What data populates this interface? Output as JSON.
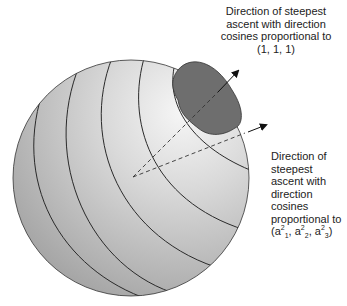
{
  "figure": {
    "type": "sphere-diagram",
    "colors": {
      "sphere_light": "#f4f4f4",
      "sphere_dark": "#a8a8a8",
      "region": "#6e6e6e",
      "line": "#2a2a2a"
    }
  },
  "labels": {
    "top": {
      "lines": [
        "Direction of steepest",
        "ascent with direction",
        "cosines proportional to",
        "(1, 1, 1)"
      ]
    },
    "right": {
      "lines": [
        "Direction of",
        "steepest",
        "ascent with",
        "direction",
        "cosines",
        "proportional to"
      ],
      "formula": {
        "open": "(a",
        "sub1": "1",
        "sup1": "2",
        "sep1": ", a",
        "sub2": "2",
        "sup2": "2",
        "sep2": ", a",
        "sub3": "3",
        "sup3": "2",
        "close": ")"
      }
    }
  }
}
